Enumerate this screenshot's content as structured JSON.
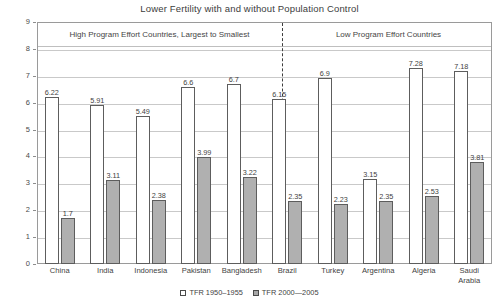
{
  "chart_data": {
    "type": "bar",
    "title": "Lower Fertility with and without Population Control",
    "xlabel": "",
    "ylabel": "Total Fertility Rate",
    "ylim": [
      0,
      9
    ],
    "yticks": [
      0,
      1,
      2,
      3,
      4,
      5,
      6,
      7,
      8,
      9
    ],
    "grid": true,
    "legend_position": "bottom",
    "categories": [
      "China",
      "India",
      "Indonesia",
      "Pakistan",
      "Bangladesh",
      "Brazil",
      "Turkey",
      "Argentina",
      "Algeria",
      "Saudi Arabia"
    ],
    "series": [
      {
        "name": "TFR 1950–1955",
        "values": [
          6.22,
          5.91,
          5.49,
          6.6,
          6.7,
          6.15,
          6.9,
          3.15,
          7.28,
          7.18
        ]
      },
      {
        "name": "TFR 2000—2005",
        "values": [
          1.7,
          3.11,
          2.38,
          3.99,
          3.22,
          2.35,
          2.23,
          2.35,
          2.53,
          3.81
        ]
      }
    ],
    "panels": [
      {
        "label": "High Program Effort Countries, Largest to Smallest",
        "categories": [
          "China",
          "India",
          "Indonesia",
          "Pakistan",
          "Bangladesh"
        ]
      },
      {
        "label": "Low Program Effort Countries",
        "categories": [
          "Brazil",
          "Turkey",
          "Argentina",
          "Algeria",
          "Saudi Arabia"
        ]
      }
    ],
    "value_labels": {
      "series_1": [
        "6.22",
        "5.91",
        "5.49",
        "6.6",
        "6.7",
        "6.15",
        "6.9",
        "3.15",
        "7.28",
        "7.18"
      ],
      "series_2": [
        "1.7",
        "3.11",
        "2.38",
        "3.99",
        "3.22",
        "2.35",
        "2.23",
        "2.35",
        "2.53",
        "3.81"
      ]
    },
    "category_label_lines": [
      [
        "China"
      ],
      [
        "India"
      ],
      [
        "Indonesia"
      ],
      [
        "Pakistan"
      ],
      [
        "Bangladesh"
      ],
      [
        "Brazil"
      ],
      [
        "Turkey"
      ],
      [
        "Argentina"
      ],
      [
        "Algeria"
      ],
      [
        "Saudi",
        "Arabia"
      ]
    ],
    "colors": {
      "series_1_fill": "#ffffff",
      "series_2_fill": "#b0b0b0",
      "bar_outline": "#5d5d5d",
      "grid": "#c9c9c9",
      "frame": "#9a9a9a",
      "text": "#3f3f3f"
    }
  },
  "legend": {
    "items": [
      {
        "label": "TFR 1950–1955",
        "swatch": "old"
      },
      {
        "label": "TFR 2000—2005",
        "swatch": "new"
      }
    ]
  }
}
